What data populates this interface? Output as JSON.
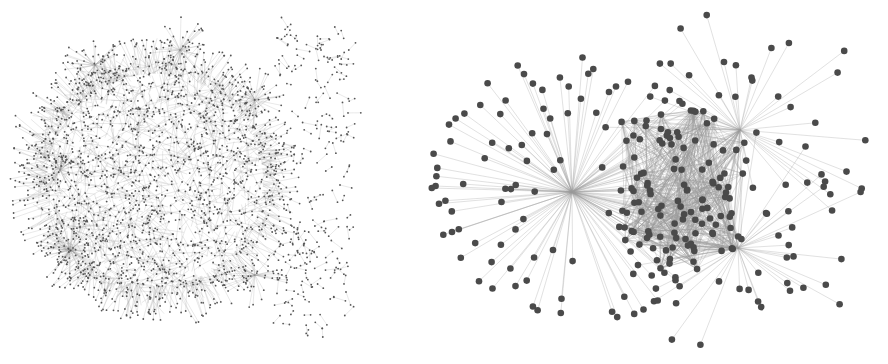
{
  "figure": {
    "background": "#ffffff",
    "panels": [
      {
        "id": "left",
        "description": "Large dense network with a giant connected component and scattered small components to the right",
        "edge_color": "#8a8a8a",
        "node_color": "#555555",
        "core": {
          "cx": 155,
          "cy": 180,
          "rx": 120,
          "ry": 118,
          "node_count": 1400,
          "edge_count": 2200
        },
        "hubs": [
          {
            "x": 70,
            "y": 250,
            "leaves": 60
          },
          {
            "x": 95,
            "y": 65,
            "leaves": 40
          },
          {
            "x": 255,
            "y": 275,
            "leaves": 35
          },
          {
            "x": 255,
            "y": 100,
            "leaves": 40
          },
          {
            "x": 180,
            "y": 50,
            "leaves": 45
          },
          {
            "x": 60,
            "y": 170,
            "leaves": 40
          }
        ],
        "satellites": {
          "x0": 275,
          "x1": 350,
          "y0": 25,
          "y1": 330,
          "pair_count": 170
        }
      },
      {
        "id": "right",
        "description": "Two-community network: a star hub on the left and a dense cluster with two hubs on the right",
        "edge_color": "#9a9a9a",
        "node_color": "#4a4a4a",
        "node_radius": 3.3,
        "star_hub": {
          "x": 152,
          "y": 192,
          "leaves": 110,
          "min_r": 25,
          "max_r": 145
        },
        "cluster": {
          "cx": 265,
          "cy": 190,
          "rx": 80,
          "ry": 110,
          "node_count": 70,
          "edge_count": 650
        },
        "cluster_hubs": [
          {
            "x": 320,
            "y": 130,
            "leaves": 45
          },
          {
            "x": 318,
            "y": 248,
            "leaves": 45
          }
        ]
      }
    ]
  }
}
